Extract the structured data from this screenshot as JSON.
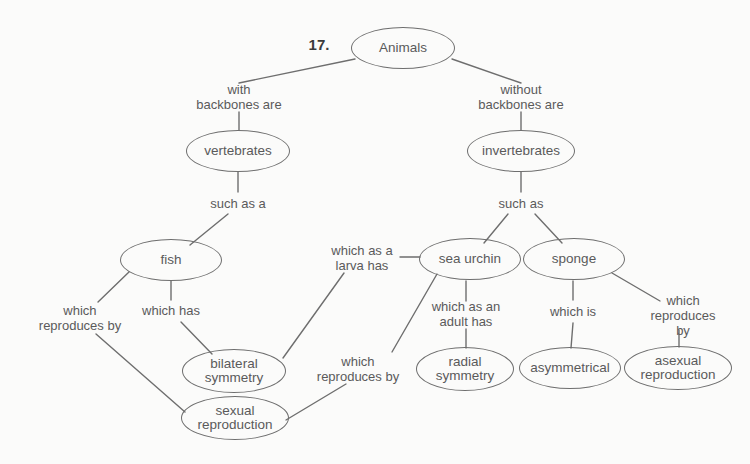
{
  "diagram": {
    "question_number": "17.",
    "title_node": "Animals",
    "stroke_color": "#6e6e6e",
    "text_color": "#5a5a5a",
    "background_color": "#fbfbfa",
    "nodes": [
      {
        "id": "animals",
        "label": "Animals",
        "cx": 403,
        "cy": 48,
        "rx": 52,
        "ry": 21
      },
      {
        "id": "vertebrates",
        "label": "vertebrates",
        "cx": 238,
        "cy": 151,
        "rx": 52,
        "ry": 21
      },
      {
        "id": "invertebrates",
        "label": "invertebrates",
        "cx": 521,
        "cy": 151,
        "rx": 54,
        "ry": 21
      },
      {
        "id": "fish",
        "label": "fish",
        "cx": 171,
        "cy": 260,
        "rx": 51,
        "ry": 21
      },
      {
        "id": "sea-urchin",
        "label": "sea urchin",
        "cx": 470,
        "cy": 259,
        "rx": 51,
        "ry": 21
      },
      {
        "id": "sponge",
        "label": "sponge",
        "cx": 574,
        "cy": 259,
        "rx": 51,
        "ry": 21
      },
      {
        "id": "bilateral-symmetry",
        "label": "bilateral\nsymmetry",
        "cx": 234,
        "cy": 371,
        "rx": 52,
        "ry": 22
      },
      {
        "id": "sexual-reproduction",
        "label": "sexual\nreproduction",
        "cx": 235,
        "cy": 418,
        "rx": 54,
        "ry": 22
      },
      {
        "id": "radial-symmetry",
        "label": "radial\nsymmetry",
        "cx": 465,
        "cy": 369,
        "rx": 49,
        "ry": 22
      },
      {
        "id": "asymmetrical",
        "label": "asymmetrical",
        "cx": 570,
        "cy": 368,
        "rx": 51,
        "ry": 21
      },
      {
        "id": "asexual-reproduction",
        "label": "asexual\nreproduction",
        "cx": 678,
        "cy": 368,
        "rx": 54,
        "ry": 22
      }
    ],
    "link_labels": [
      {
        "id": "with-backbones-are",
        "text": "with\nbackbones are",
        "x": 239,
        "y": 97
      },
      {
        "id": "without-backbones-are",
        "text": "without\nbackbones are",
        "x": 521,
        "y": 97
      },
      {
        "id": "such-as-a",
        "text": "such as a",
        "x": 238,
        "y": 203
      },
      {
        "id": "such-as",
        "text": "such as",
        "x": 521,
        "y": 203
      },
      {
        "id": "which-reproduces-by-fish",
        "text": "which\nreproduces by",
        "x": 80,
        "y": 318
      },
      {
        "id": "which-has",
        "text": "which has",
        "x": 171,
        "y": 310
      },
      {
        "id": "which-as-a-larva-has",
        "text": "which as a\nlarva has",
        "x": 362,
        "y": 258
      },
      {
        "id": "which-reproduces-by-urchin",
        "text": "which\nreproduces by",
        "x": 358,
        "y": 369
      },
      {
        "id": "which-as-an-adult-has",
        "text": "which as an\nadult has",
        "x": 466,
        "y": 314
      },
      {
        "id": "which-is",
        "text": "which is",
        "x": 573,
        "y": 311
      },
      {
        "id": "which-reproduces-by-sponge",
        "text": "which\nreproduces by",
        "x": 683,
        "y": 315
      }
    ],
    "edges": [
      {
        "id": "animals-to-vertebrates",
        "x1": 355,
        "y1": 59,
        "x2": 239,
        "y2": 83
      },
      {
        "id": "animals-to-invertebrates",
        "x1": 452,
        "y1": 59,
        "x2": 521,
        "y2": 83
      },
      {
        "id": "with-backbones-to-vertebrates",
        "x1": 239,
        "y1": 112,
        "x2": 239,
        "y2": 130
      },
      {
        "id": "without-backbones-to-invertebrates",
        "x1": 521,
        "y1": 112,
        "x2": 521,
        "y2": 130
      },
      {
        "id": "vertebrates-to-suchasa",
        "x1": 238,
        "y1": 172,
        "x2": 238,
        "y2": 192
      },
      {
        "id": "invertebrates-to-suchas",
        "x1": 521,
        "y1": 172,
        "x2": 521,
        "y2": 192
      },
      {
        "id": "suchasa-to-fish",
        "x1": 228,
        "y1": 214,
        "x2": 190,
        "y2": 245
      },
      {
        "id": "suchas-to-sea-urchin",
        "x1": 508,
        "y1": 214,
        "x2": 484,
        "y2": 243
      },
      {
        "id": "suchas-to-sponge",
        "x1": 535,
        "y1": 214,
        "x2": 562,
        "y2": 243
      },
      {
        "id": "fish-to-which-reproduces-by",
        "x1": 129,
        "y1": 272,
        "x2": 98,
        "y2": 302
      },
      {
        "id": "fish-to-which-has",
        "x1": 171,
        "y1": 281,
        "x2": 171,
        "y2": 300
      },
      {
        "id": "which-has-to-bilateral",
        "x1": 181,
        "y1": 322,
        "x2": 212,
        "y2": 354
      },
      {
        "id": "which-reproduces-by-to-sexual",
        "x1": 96,
        "y1": 334,
        "x2": 185,
        "y2": 412
      },
      {
        "id": "sea-urchin-to-larva-label",
        "x1": 420,
        "y1": 257,
        "x2": 400,
        "y2": 257
      },
      {
        "id": "larva-label-to-bilateral",
        "x1": 344,
        "y1": 273,
        "x2": 283,
        "y2": 358
      },
      {
        "id": "sea-urchin-to-reproduces-label",
        "x1": 437,
        "y1": 274,
        "x2": 392,
        "y2": 352
      },
      {
        "id": "reproduces-label-to-sexual",
        "x1": 346,
        "y1": 384,
        "x2": 286,
        "y2": 420
      },
      {
        "id": "sea-urchin-to-adult-label",
        "x1": 466,
        "y1": 281,
        "x2": 466,
        "y2": 301
      },
      {
        "id": "adult-label-to-radial",
        "x1": 466,
        "y1": 329,
        "x2": 466,
        "y2": 348
      },
      {
        "id": "sponge-to-which-is",
        "x1": 573,
        "y1": 281,
        "x2": 573,
        "y2": 300
      },
      {
        "id": "which-is-to-asymmetrical",
        "x1": 573,
        "y1": 323,
        "x2": 571,
        "y2": 348
      },
      {
        "id": "sponge-to-reproduces-label",
        "x1": 612,
        "y1": 273,
        "x2": 660,
        "y2": 301
      },
      {
        "id": "sponge-reproduces-to-asexual",
        "x1": 679,
        "y1": 330,
        "x2": 679,
        "y2": 347
      }
    ]
  }
}
